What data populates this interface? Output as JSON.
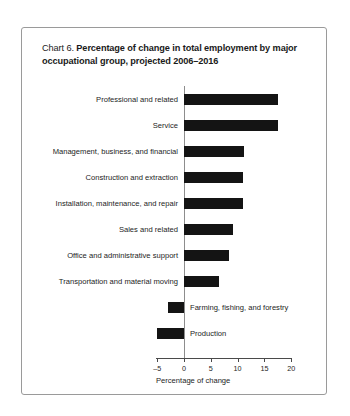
{
  "chart_data": {
    "type": "bar",
    "orientation": "horizontal",
    "title_lead": "Chart 6.",
    "title": "Percentage of change in total employment by major occupational group, projected 2006–2016",
    "xlabel": "Percentage of change",
    "ylabel": "",
    "xlim": [
      -5,
      20
    ],
    "xticks": [
      -5,
      0,
      5,
      10,
      15,
      20
    ],
    "xticklabels": [
      "–5",
      "0",
      "5",
      "10",
      "15",
      "20"
    ],
    "grid": false,
    "legend": null,
    "bar_color": "#141414",
    "categories": [
      "Professional and related",
      "Service",
      "Management, business, and financial",
      "Construction and extraction",
      "Installation, maintenance, and repair",
      "Sales and related",
      "Office and administrative support",
      "Transportation and material moving",
      "Farming, fishing, and forestry",
      "Production"
    ],
    "values": [
      17.5,
      17.5,
      11.2,
      11.0,
      11.0,
      9.2,
      8.4,
      6.5,
      -3.0,
      -5.0
    ]
  }
}
